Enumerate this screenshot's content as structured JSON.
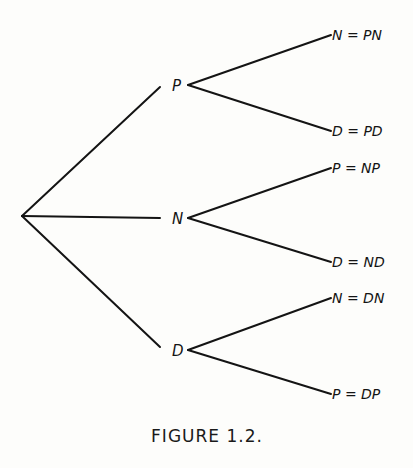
{
  "figure": {
    "caption": "FIGURE 1.2.",
    "tree": {
      "root": "",
      "children": [
        {
          "label": "P",
          "children": [
            {
              "label": "N = PN"
            },
            {
              "label": "D = PD"
            }
          ]
        },
        {
          "label": "N",
          "children": [
            {
              "label": "P = NP"
            },
            {
              "label": "D = ND"
            }
          ]
        },
        {
          "label": "D",
          "children": [
            {
              "label": "N = DN"
            },
            {
              "label": "P = DP"
            }
          ]
        }
      ]
    }
  }
}
